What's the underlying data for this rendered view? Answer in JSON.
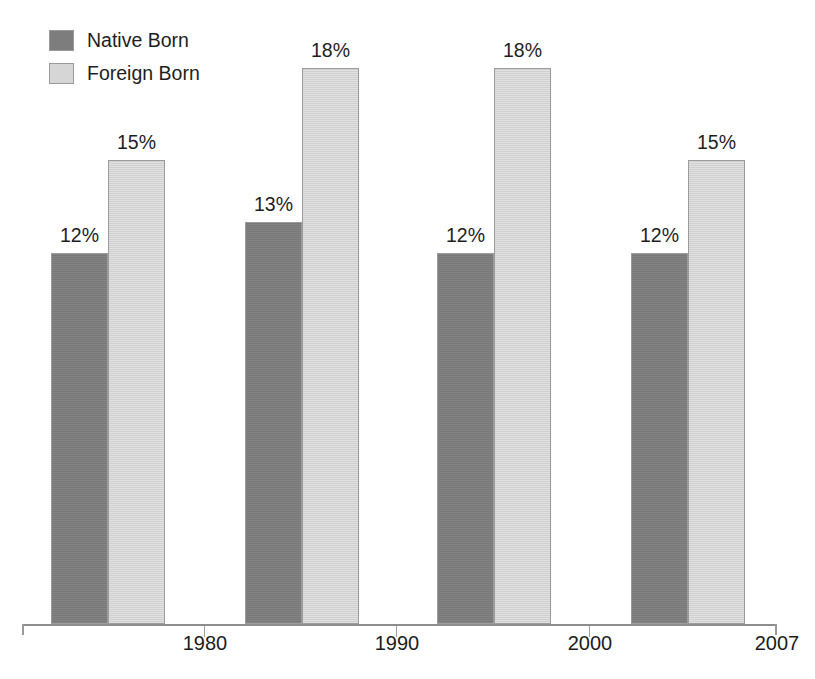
{
  "chart_data": {
    "type": "bar",
    "title": "",
    "xlabel": "",
    "ylabel": "",
    "ylim": [
      0,
      20
    ],
    "grid": false,
    "legend_position": "top-left",
    "value_suffix": "%",
    "categories": [
      "1980",
      "1990",
      "2000",
      "2007"
    ],
    "series": [
      {
        "name": "Native Born",
        "color": "#7d7d7d",
        "values": [
          12,
          13,
          12,
          12
        ],
        "labels": [
          "12%",
          "13%",
          "12%",
          "12%"
        ]
      },
      {
        "name": "Foreign Born",
        "color": "#d6d6d6",
        "values": [
          15,
          18,
          18,
          15
        ],
        "labels": [
          "15%",
          "18%",
          "18%",
          "15%"
        ]
      }
    ],
    "annotations": []
  },
  "legend": {
    "items": [
      {
        "label": "Native Born",
        "swatch": "native"
      },
      {
        "label": "Foreign Born",
        "swatch": "foreign"
      }
    ]
  },
  "axis": {
    "tick_labels": [
      "1980",
      "1990",
      "2000",
      "2007"
    ]
  },
  "colors": {
    "native_born": "#7d7d7d",
    "foreign_born": "#d6d6d6",
    "axis": "#8d8d8d",
    "text": "#1a1a1a"
  }
}
